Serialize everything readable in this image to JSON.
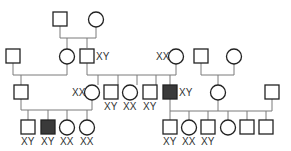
{
  "diagram": {
    "type": "pedigree",
    "generations": [
      {
        "id": "I",
        "members": [
          {
            "id": "I-1",
            "sex": "male",
            "affected": false,
            "label": ""
          },
          {
            "id": "I-2",
            "sex": "female",
            "affected": false,
            "label": ""
          }
        ]
      },
      {
        "id": "II",
        "members": [
          {
            "id": "II-1",
            "sex": "male",
            "affected": false,
            "label": ""
          },
          {
            "id": "II-2",
            "sex": "female",
            "affected": false,
            "label": ""
          },
          {
            "id": "II-3",
            "sex": "male",
            "affected": false,
            "label": "XY"
          },
          {
            "id": "II-4",
            "sex": "female",
            "affected": false,
            "label": "XX"
          },
          {
            "id": "II-5",
            "sex": "male",
            "affected": false,
            "label": ""
          },
          {
            "id": "II-6",
            "sex": "female",
            "affected": false,
            "label": ""
          }
        ]
      },
      {
        "id": "III",
        "members": [
          {
            "id": "III-1",
            "sex": "male",
            "affected": false,
            "label": ""
          },
          {
            "id": "III-2",
            "sex": "female",
            "affected": false,
            "label": "XX"
          },
          {
            "id": "III-3",
            "sex": "male",
            "affected": false,
            "label": "XY"
          },
          {
            "id": "III-4",
            "sex": "female",
            "affected": false,
            "label": "XX"
          },
          {
            "id": "III-5",
            "sex": "male",
            "affected": false,
            "label": "XY"
          },
          {
            "id": "III-6",
            "sex": "male",
            "affected": true,
            "label": "XY"
          },
          {
            "id": "III-7",
            "sex": "female",
            "affected": false,
            "label": ""
          },
          {
            "id": "III-8",
            "sex": "male",
            "affected": false,
            "label": ""
          }
        ]
      },
      {
        "id": "IV",
        "members": [
          {
            "id": "IV-1",
            "sex": "male",
            "affected": false,
            "label": "XY"
          },
          {
            "id": "IV-2",
            "sex": "male",
            "affected": true,
            "label": "XY"
          },
          {
            "id": "IV-3",
            "sex": "female",
            "affected": false,
            "label": "XX"
          },
          {
            "id": "IV-4",
            "sex": "female",
            "affected": false,
            "label": "XX"
          },
          {
            "id": "IV-5",
            "sex": "male",
            "affected": false,
            "label": "XY"
          },
          {
            "id": "IV-6",
            "sex": "female",
            "affected": false,
            "label": "XX"
          },
          {
            "id": "IV-7",
            "sex": "male",
            "affected": false,
            "label": "XY"
          },
          {
            "id": "IV-8",
            "sex": "female",
            "affected": false,
            "label": ""
          },
          {
            "id": "IV-9",
            "sex": "male",
            "affected": false,
            "label": ""
          },
          {
            "id": "IV-10",
            "sex": "male",
            "affected": false,
            "label": ""
          }
        ]
      }
    ],
    "labels": {
      "II-3": "XY",
      "II-4": "XX",
      "III-2": "XX",
      "III-3": "XY",
      "III-4": "XX",
      "III-5": "XY",
      "III-6": "XY",
      "IV-1": "XY",
      "IV-2": "XY",
      "IV-3": "XX",
      "IV-4": "XX",
      "IV-5": "XY",
      "IV-6": "XX",
      "IV-7": "XY"
    },
    "colors": {
      "affected_fill": "#3a3a3a",
      "outline": "#222222",
      "line": "#7a7a7a"
    }
  }
}
